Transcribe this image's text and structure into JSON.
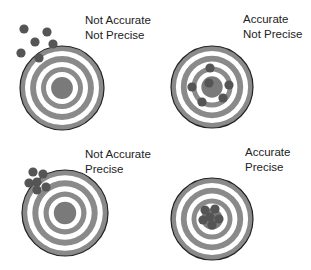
{
  "colors": {
    "ring_gray": "#8a8a8a",
    "bullseye": "#7a7a7a",
    "dot": "#555555",
    "outline": "#222222",
    "background": "#ffffff"
  },
  "panels": [
    {
      "id": "not-accurate-not-precise",
      "line1": "Not Accurate",
      "line2": "Not Precise",
      "label_pos": [
        85,
        13
      ],
      "target": {
        "cx": 62,
        "cy": 88,
        "r": 42
      },
      "dots": [
        [
          24,
          29
        ],
        [
          47,
          32
        ],
        [
          35,
          42
        ],
        [
          53,
          44
        ],
        [
          21,
          53
        ],
        [
          39,
          58
        ]
      ]
    },
    {
      "id": "accurate-not-precise",
      "line1": "Accurate",
      "line2": "Not Precise",
      "label_pos": [
        243,
        12
      ],
      "target": {
        "cx": 212,
        "cy": 87,
        "r": 41
      },
      "dots": [
        [
          210,
          68
        ],
        [
          192,
          87
        ],
        [
          229,
          85
        ],
        [
          209,
          83
        ],
        [
          223,
          98
        ],
        [
          202,
          102
        ]
      ]
    },
    {
      "id": "not-accurate-precise",
      "line1": "Not Accurate",
      "line2": "Precise",
      "label_pos": [
        85,
        147
      ],
      "target": {
        "cx": 65,
        "cy": 213,
        "r": 43
      },
      "dots": [
        [
          33,
          172
        ],
        [
          43,
          174
        ],
        [
          29,
          183
        ],
        [
          37,
          182
        ],
        [
          46,
          187
        ],
        [
          37,
          190
        ]
      ]
    },
    {
      "id": "accurate-precise",
      "line1": "Accurate",
      "line2": "Precise",
      "label_pos": [
        245,
        145
      ],
      "target": {
        "cx": 212,
        "cy": 219,
        "r": 41
      },
      "dots": [
        [
          205,
          210
        ],
        [
          215,
          209
        ],
        [
          203,
          220
        ],
        [
          210,
          217
        ],
        [
          219,
          219
        ],
        [
          212,
          225
        ]
      ]
    }
  ]
}
